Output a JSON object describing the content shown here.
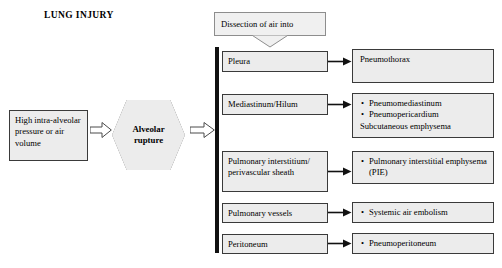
{
  "diagram": {
    "title": "LUNG INJURY",
    "callout": {
      "label": "Dissection of air into",
      "icon": "callout-tail-icon"
    },
    "source_box": {
      "label": "High intra-alveolar pressure or air volume"
    },
    "event_node": {
      "label_line1": "Alveolar",
      "label_line2": "rupture"
    },
    "arrows": {
      "block_arrow_1": "block-arrow-icon",
      "block_arrow_2": "block-arrow-icon",
      "connector": "arrow-right-icon"
    },
    "rows": [
      {
        "site": "Pleura",
        "outcomes": [
          {
            "text": "Pneumothorax",
            "bullet": false
          }
        ]
      },
      {
        "site": "Mediastinum/Hilum",
        "outcomes": [
          {
            "text": "Pneumomediastinum",
            "bullet": true
          },
          {
            "text": "Pneumopericardium",
            "bullet": true
          },
          {
            "text": "Subcutaneous emphysema",
            "bullet": false
          }
        ]
      },
      {
        "site": "Pulmonary interstitium/ perivascular sheath",
        "outcomes": [
          {
            "text": "Pulmonary interstitial emphysema (PIE)",
            "bullet": true
          }
        ]
      },
      {
        "site": "Pulmonary vessels",
        "outcomes": [
          {
            "text": "Systemic air embolism",
            "bullet": true
          }
        ]
      },
      {
        "site": "Peritoneum",
        "outcomes": [
          {
            "text": "Pneumoperitoneum",
            "bullet": true
          }
        ]
      }
    ],
    "colors": {
      "box_fill": "#ececec",
      "box_border": "#3a3a3a",
      "trunk": "#111111",
      "callout_fill": "#f0f0f0",
      "callout_border": "#8d8d8d",
      "background": "#ffffff"
    }
  }
}
